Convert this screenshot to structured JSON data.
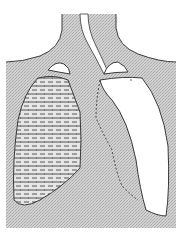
{
  "diagram": {
    "type": "anatomical-illustration",
    "labels": [],
    "colors": {
      "background": "#ffffff",
      "tissue_fill": "#c9c9c9",
      "hatch_line": "#9a9a9a",
      "outline": "#3a3a3a",
      "lung_clear": "#ffffff",
      "fluid_dash": "#444444"
    },
    "regions": [
      {
        "name": "neck-and-thorax",
        "fill": "stippled-gray"
      },
      {
        "name": "trachea",
        "fill": "white"
      },
      {
        "name": "left-lung-fluid",
        "fill": "dashed-hatch"
      },
      {
        "name": "right-lung-air",
        "fill": "white"
      },
      {
        "name": "left-apex-pocket",
        "fill": "white"
      },
      {
        "name": "right-apex-pocket",
        "fill": "white"
      }
    ]
  }
}
